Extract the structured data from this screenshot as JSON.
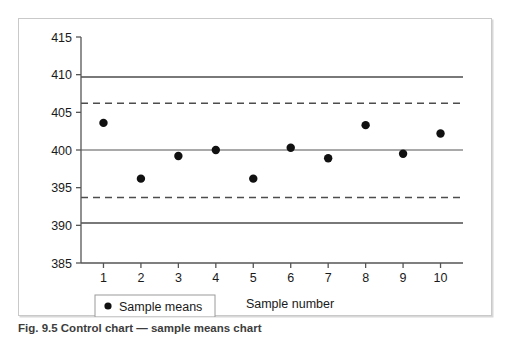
{
  "figure": {
    "caption": "Fig. 9.5 Control chart — sample means chart"
  },
  "chart_data": {
    "type": "scatter",
    "title": "",
    "xlabel": "Sample number",
    "ylabel": "",
    "x": [
      1,
      2,
      3,
      4,
      5,
      6,
      7,
      8,
      9,
      10
    ],
    "values": [
      403.6,
      396.2,
      399.2,
      400.0,
      396.2,
      400.3,
      398.9,
      403.3,
      399.5,
      402.2
    ],
    "series": [
      {
        "name": "Sample means",
        "values": [
          403.6,
          396.2,
          399.2,
          400.0,
          396.2,
          400.3,
          398.9,
          403.3,
          399.5,
          402.2
        ]
      }
    ],
    "xlim": [
      0.4,
      10.6
    ],
    "ylim": [
      385,
      415
    ],
    "ytick_labels": [
      "385",
      "390",
      "395",
      "400",
      "405",
      "410",
      "415"
    ],
    "yticks": [
      385,
      390,
      395,
      400,
      405,
      410,
      415
    ],
    "xtick_labels": [
      "1",
      "2",
      "3",
      "4",
      "5",
      "6",
      "7",
      "8",
      "9",
      "10"
    ],
    "xticks": [
      1,
      2,
      3,
      4,
      5,
      6,
      7,
      8,
      9,
      10
    ],
    "grid": false,
    "legend_position": "bottom-left",
    "marker": "filled-circle",
    "marker_color": "#111111",
    "reference_lines": [
      {
        "name": "upper-control-limit",
        "value": 409.7,
        "style": "solid",
        "color": "#4d4d4d"
      },
      {
        "name": "upper-warning-limit",
        "value": 406.2,
        "style": "dashed",
        "color": "#4d4d4d"
      },
      {
        "name": "centre-line",
        "value": 400.0,
        "style": "solid",
        "color": "#8c8c8c"
      },
      {
        "name": "lower-warning-limit",
        "value": 393.7,
        "style": "dashed",
        "color": "#4d4d4d"
      },
      {
        "name": "lower-control-limit",
        "value": 390.3,
        "style": "solid",
        "color": "#4d4d4d"
      }
    ]
  },
  "legend": {
    "entries": [
      {
        "label": "Sample means",
        "marker": "filled-circle",
        "color": "#111111"
      }
    ]
  },
  "axis_titles": {
    "x": "Sample number"
  }
}
